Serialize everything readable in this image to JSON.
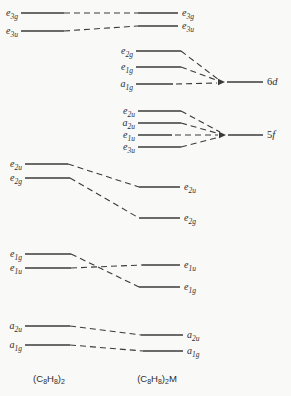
{
  "colors": {
    "background": "#f9f9f7",
    "line": "#3a3a3a",
    "text": "#2e2e2e"
  },
  "diagram": {
    "width": 291,
    "height": 396,
    "dash_pattern": "6 4",
    "levels": [
      {
        "id": "e3g-ligand",
        "base": "e",
        "sub": "3g",
        "x1": 21,
        "x2": 64,
        "y": 13,
        "labelSide": "left"
      },
      {
        "id": "e3u-ligand",
        "base": "e",
        "sub": "3u",
        "x1": 21,
        "x2": 64,
        "y": 31,
        "labelSide": "left"
      },
      {
        "id": "e3g-complex",
        "base": "e",
        "sub": "3g",
        "x1": 138,
        "x2": 178,
        "y": 13,
        "labelSide": "right"
      },
      {
        "id": "e3u-complex",
        "base": "e",
        "sub": "3u",
        "x1": 138,
        "x2": 178,
        "y": 26,
        "labelSide": "right"
      },
      {
        "id": "e2g-metal",
        "base": "e",
        "sub": "2g",
        "x1": 136,
        "x2": 181,
        "y": 51,
        "labelSide": "left"
      },
      {
        "id": "e1g-metal",
        "base": "e",
        "sub": "1g",
        "x1": 136,
        "x2": 181,
        "y": 67,
        "labelSide": "left"
      },
      {
        "id": "a1g-metal",
        "base": "a",
        "sub": "1g",
        "x1": 136,
        "x2": 173,
        "y": 84,
        "labelSide": "left"
      },
      {
        "id": "e2u-metal",
        "base": "e",
        "sub": "2u",
        "x1": 138,
        "x2": 181,
        "y": 111,
        "labelSide": "left"
      },
      {
        "id": "a2u-metal",
        "base": "a",
        "sub": "2u",
        "x1": 138,
        "x2": 181,
        "y": 123,
        "labelSide": "left"
      },
      {
        "id": "e1u-metal",
        "base": "e",
        "sub": "1u",
        "x1": 138,
        "x2": 172,
        "y": 135,
        "labelSide": "left"
      },
      {
        "id": "e3u-metal",
        "base": "e",
        "sub": "3u",
        "x1": 138,
        "x2": 181,
        "y": 147,
        "labelSide": "left"
      },
      {
        "id": "e2u-ligand",
        "base": "e",
        "sub": "2u",
        "x1": 25,
        "x2": 68,
        "y": 164,
        "labelSide": "left"
      },
      {
        "id": "e2g-ligand",
        "base": "e",
        "sub": "2g",
        "x1": 25,
        "x2": 70,
        "y": 178,
        "labelSide": "left"
      },
      {
        "id": "e2u-complex",
        "base": "e",
        "sub": "2u",
        "x1": 139,
        "x2": 180,
        "y": 187,
        "labelSide": "right"
      },
      {
        "id": "e2g-complex",
        "base": "e",
        "sub": "2g",
        "x1": 139,
        "x2": 180,
        "y": 218,
        "labelSide": "right"
      },
      {
        "id": "e1g-ligand",
        "base": "e",
        "sub": "1g",
        "x1": 25,
        "x2": 71,
        "y": 254,
        "labelSide": "left"
      },
      {
        "id": "e1u-ligand",
        "base": "e",
        "sub": "1u",
        "x1": 25,
        "x2": 71,
        "y": 268,
        "labelSide": "left"
      },
      {
        "id": "e1u-complex",
        "base": "e",
        "sub": "1u",
        "x1": 142,
        "x2": 180,
        "y": 265,
        "labelSide": "right"
      },
      {
        "id": "e1g-complex",
        "base": "e",
        "sub": "1g",
        "x1": 139,
        "x2": 180,
        "y": 287,
        "labelSide": "right"
      },
      {
        "id": "a2u-ligand",
        "base": "a",
        "sub": "2u",
        "x1": 25,
        "x2": 70,
        "y": 326,
        "labelSide": "left"
      },
      {
        "id": "a1g-ligand",
        "base": "a",
        "sub": "1g",
        "x1": 25,
        "x2": 70,
        "y": 345,
        "labelSide": "left"
      },
      {
        "id": "a2u-complex",
        "base": "a",
        "sub": "2u",
        "x1": 141,
        "x2": 183,
        "y": 335,
        "labelSide": "right"
      },
      {
        "id": "a1g-complex",
        "base": "a",
        "sub": "1g",
        "x1": 143,
        "x2": 183,
        "y": 351,
        "labelSide": "right"
      }
    ],
    "connections": [
      [
        64,
        13,
        138,
        13
      ],
      [
        64,
        31,
        138,
        26
      ],
      [
        181,
        51,
        219,
        80
      ],
      [
        181,
        67,
        219,
        81
      ],
      [
        176,
        84,
        217,
        83
      ],
      [
        181,
        111,
        220,
        132
      ],
      [
        181,
        123,
        220,
        134
      ],
      [
        175,
        135,
        218,
        135
      ],
      [
        181,
        147,
        220,
        137
      ],
      [
        68,
        164,
        139,
        187
      ],
      [
        70,
        178,
        139,
        218
      ],
      [
        71,
        254,
        139,
        287
      ],
      [
        71,
        268,
        142,
        265
      ],
      [
        70,
        326,
        141,
        335
      ],
      [
        70,
        345,
        143,
        351
      ]
    ],
    "arrows": [
      {
        "id": "6d-convergence",
        "x": 225,
        "y": 82
      },
      {
        "id": "5f-convergence",
        "x": 226,
        "y": 135
      }
    ],
    "atomic_levels": [
      {
        "id": "6d",
        "num": "6",
        "letter": "d",
        "x1": 227,
        "x2": 263,
        "y": 82
      },
      {
        "id": "5f",
        "num": "5",
        "letter": "f",
        "x1": 228,
        "x2": 263,
        "y": 135
      }
    ],
    "captions": [
      {
        "id": "ligand-column",
        "x": 49,
        "y": 379,
        "parts": [
          {
            "t": "(C"
          },
          {
            "t": "8",
            "sub": true
          },
          {
            "t": "H"
          },
          {
            "t": "8",
            "sub": true
          },
          {
            "t": ")"
          },
          {
            "t": "2",
            "sub": true
          }
        ]
      },
      {
        "id": "complex-column",
        "x": 157,
        "y": 379,
        "parts": [
          {
            "t": "(C"
          },
          {
            "t": "8",
            "sub": true
          },
          {
            "t": "H"
          },
          {
            "t": "8",
            "sub": true
          },
          {
            "t": ")"
          },
          {
            "t": "2",
            "sub": true
          },
          {
            "t": "M"
          }
        ]
      }
    ]
  }
}
